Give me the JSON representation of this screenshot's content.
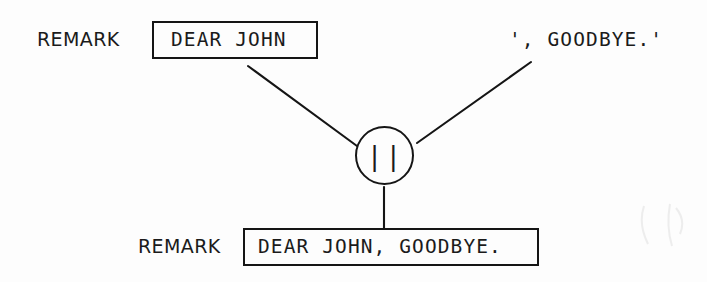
{
  "diagram": {
    "background_color": "#fdfdfd",
    "ink_color": "#151515"
  },
  "top_row": {
    "keyword_label": "REMARK",
    "left_operand": "DEAR JOHN",
    "right_operand": "', GOODBYE.'"
  },
  "operator_node": {
    "symbol": "||",
    "name": "concatenation-operator",
    "shape": "circle"
  },
  "bottom_row": {
    "keyword_label": "REMARK",
    "result": "DEAR JOHN, GOODBYE."
  },
  "connectors": {
    "left_branch": "diagonal from left operand box down-right to operator",
    "right_branch": "diagonal from right operand text down-left to operator",
    "result_branch": "vertical from operator down to result box"
  }
}
